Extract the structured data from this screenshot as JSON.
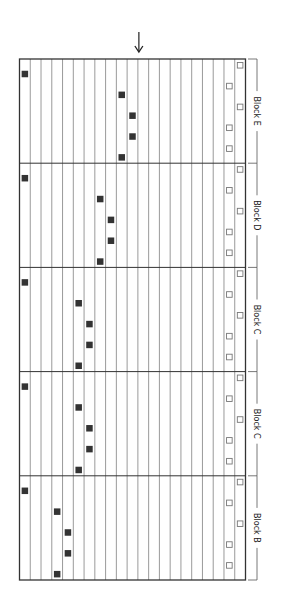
{
  "diagram": {
    "title": "",
    "indicator_arrow": {
      "icon": "down-arrow-icon",
      "column_index": 11
    },
    "grid": {
      "columns": 21,
      "rows_per_block": 5,
      "left": 19.5,
      "right": 245.5,
      "top": 59,
      "bottom": 580,
      "colors": {
        "border": "#333333",
        "column_line": "#9a9a9a",
        "block_divider": "#333333",
        "filled_marker": "#333333",
        "open_marker_stroke": "#777777",
        "bracket": "#555555"
      }
    },
    "blocks": [
      {
        "label": "Block E",
        "start_marker_col": 0,
        "filled_markers_cols": [
          9,
          10,
          10,
          9
        ],
        "open_markers_cols": [
          20,
          19,
          20,
          19,
          19
        ]
      },
      {
        "label": "Block D",
        "start_marker_col": 0,
        "filled_markers_cols": [
          7,
          8,
          8,
          7
        ],
        "open_markers_cols": [
          20,
          19,
          20,
          19,
          19
        ]
      },
      {
        "label": "Block C",
        "start_marker_col": 0,
        "filled_markers_cols": [
          5,
          6,
          6,
          5
        ],
        "open_markers_cols": [
          20,
          19,
          20,
          19,
          19
        ]
      },
      {
        "label": "Block C",
        "start_marker_col": 0,
        "filled_markers_cols": [
          5,
          6,
          6,
          5
        ],
        "open_markers_cols": [
          20,
          19,
          20,
          19,
          19
        ]
      },
      {
        "label": "Block B",
        "start_marker_col": 0,
        "filled_markers_cols": [
          3,
          4,
          4,
          3
        ],
        "open_markers_cols": [
          20,
          19,
          20,
          19,
          19
        ]
      }
    ]
  }
}
